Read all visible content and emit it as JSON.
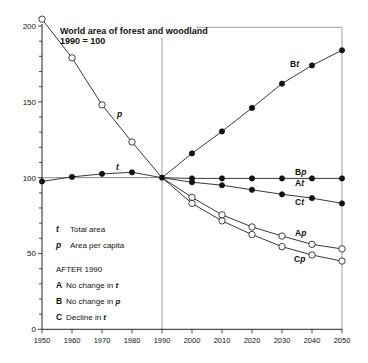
{
  "chart_data": {
    "type": "line",
    "title": "World area of forest and woodland",
    "subtitle": "1990 = 100",
    "xlabel": "",
    "ylabel": "",
    "x_ticks": [
      1950,
      1960,
      1970,
      1980,
      1990,
      2000,
      2010,
      2020,
      2030,
      2040,
      2050
    ],
    "y_ticks": [
      0,
      50,
      100,
      150,
      200
    ],
    "xlim": [
      1950,
      2050
    ],
    "ylim": [
      0,
      200
    ],
    "grid": false,
    "reference_line": {
      "x": 1990
    },
    "series": [
      {
        "name": "t",
        "label": "t",
        "description": "Total area",
        "marker": "filled",
        "x": [
          1950,
          1960,
          1970,
          1980,
          1990
        ],
        "values": [
          97.5,
          100.5,
          102.5,
          103.5,
          100
        ]
      },
      {
        "name": "p",
        "label": "p",
        "description": "Area per capita",
        "marker": "open",
        "x": [
          1950,
          1960,
          1970,
          1980,
          1990
        ],
        "values": [
          204.5,
          179,
          148,
          123.5,
          100
        ]
      },
      {
        "name": "Bt",
        "label": "Bt",
        "marker": "filled",
        "x": [
          1990,
          2000,
          2010,
          2020,
          2030,
          2040,
          2050
        ],
        "values": [
          100,
          116,
          130.5,
          146,
          162,
          174,
          184
        ]
      },
      {
        "name": "Bp / At",
        "label": "Bp",
        "label2": "At",
        "marker": "filled",
        "x": [
          1990,
          2000,
          2010,
          2020,
          2030,
          2040,
          2050
        ],
        "values": [
          100,
          99.5,
          99.5,
          99.5,
          99.5,
          99.5,
          99.5
        ]
      },
      {
        "name": "Ct",
        "label": "Ct",
        "marker": "filled",
        "x": [
          1990,
          2000,
          2010,
          2020,
          2030,
          2040,
          2050
        ],
        "values": [
          100,
          97,
          95,
          92,
          89,
          86.5,
          83
        ]
      },
      {
        "name": "Ap",
        "label": "Ap",
        "marker": "open",
        "x": [
          1990,
          2000,
          2010,
          2020,
          2030,
          2040,
          2050
        ],
        "values": [
          100,
          87,
          75.5,
          67.5,
          61.5,
          56,
          53
        ]
      },
      {
        "name": "Cp",
        "label": "Cp",
        "marker": "open",
        "x": [
          1990,
          2000,
          2010,
          2020,
          2030,
          2040,
          2050
        ],
        "values": [
          100,
          83,
          71.5,
          62.5,
          54.5,
          49,
          45
        ]
      }
    ],
    "legend": {
      "items": [
        {
          "key": "t",
          "text": "Total area"
        },
        {
          "key": "p",
          "text": "Area per capita"
        }
      ],
      "heading": "AFTER 1990",
      "scenarios": [
        {
          "key": "A",
          "text": "No change in ",
          "var": "t"
        },
        {
          "key": "B",
          "text": "No change in ",
          "var": "p"
        },
        {
          "key": "C",
          "text": "Decline in ",
          "var": "t"
        }
      ]
    }
  }
}
